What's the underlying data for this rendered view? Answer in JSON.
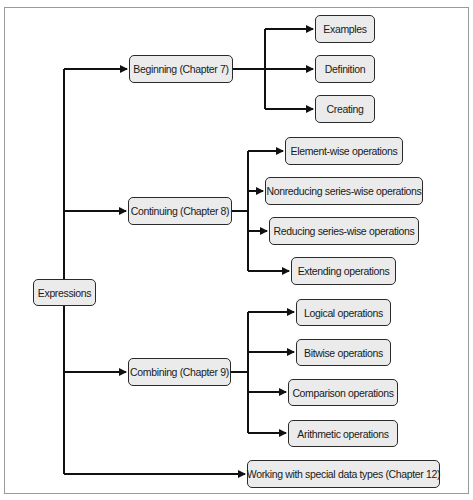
{
  "diagram": {
    "type": "tree",
    "root": {
      "id": "expressions",
      "label": "Expressions"
    },
    "branches": [
      {
        "id": "beginning",
        "label": "Beginning (Chapter 7)",
        "children": [
          {
            "id": "examples",
            "label": "Examples"
          },
          {
            "id": "definition",
            "label": "Definition"
          },
          {
            "id": "creating",
            "label": "Creating"
          }
        ]
      },
      {
        "id": "continuing",
        "label": "Continuing (Chapter 8)",
        "children": [
          {
            "id": "element-wise",
            "label": "Element-wise operations"
          },
          {
            "id": "nonreducing",
            "label": "Nonreducing series-wise operations"
          },
          {
            "id": "reducing",
            "label": "Reducing series-wise operations"
          },
          {
            "id": "extending",
            "label": "Extending operations"
          }
        ]
      },
      {
        "id": "combining",
        "label": "Combining (Chapter 9)",
        "children": [
          {
            "id": "logical",
            "label": "Logical operations"
          },
          {
            "id": "bitwise",
            "label": "Bitwise operations"
          },
          {
            "id": "comparison",
            "label": "Comparison operations"
          },
          {
            "id": "arithmetic",
            "label": "Arithmetic operations"
          }
        ]
      },
      {
        "id": "special-types",
        "label": "Working with special data types (Chapter 12)",
        "children": []
      }
    ]
  },
  "colors": {
    "node_fill": "#ebebeb",
    "node_border": "#2a2a2a",
    "line": "#111111",
    "frame": "#9a9a9a"
  }
}
